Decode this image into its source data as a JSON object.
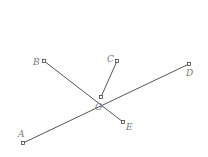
{
  "diagram": {
    "colors": {
      "line": "#555555",
      "label": "#777777",
      "background": "#ffffff"
    },
    "center": {
      "label": "O",
      "x": 101,
      "y": 97,
      "label_x": 95,
      "label_y": 110
    },
    "points": [
      {
        "label": "A",
        "x": 23,
        "y": 143,
        "label_x": 18,
        "label_y": 137
      },
      {
        "label": "B",
        "x": 44,
        "y": 61,
        "label_x": 33,
        "label_y": 65
      },
      {
        "label": "C",
        "x": 117,
        "y": 61,
        "label_x": 107,
        "label_y": 62
      },
      {
        "label": "D",
        "x": 189,
        "y": 64,
        "label_x": 186,
        "label_y": 76
      },
      {
        "label": "E",
        "x": 123,
        "y": 122,
        "label_x": 126,
        "label_y": 130
      }
    ],
    "segments": [
      {
        "from": "A",
        "to": "D",
        "through": "O"
      },
      {
        "from": "B",
        "to": "E",
        "through": "O"
      },
      {
        "from": "O",
        "to": "C"
      }
    ]
  }
}
